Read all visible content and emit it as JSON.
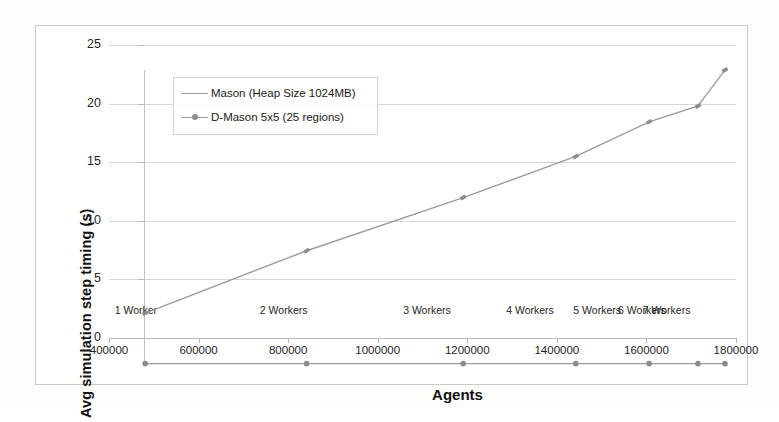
{
  "chart_data": {
    "type": "line",
    "title": "",
    "xlabel": "Agents",
    "ylabel": "Avg simulation step timing (s)",
    "xlim": [
      400000,
      1800000
    ],
    "ylim": [
      0,
      25
    ],
    "xticks": [
      "400000",
      "600000",
      "800000",
      "1000000",
      "1200000",
      "1400000",
      "1600000",
      "1800000"
    ],
    "xtick_values": [
      400000,
      600000,
      800000,
      1000000,
      1200000,
      1400000,
      1600000,
      1800000
    ],
    "yticks": [
      "0",
      "5",
      "10",
      "15",
      "20",
      "25"
    ],
    "ytick_values": [
      0,
      5,
      10,
      15,
      20,
      25
    ],
    "grid": true,
    "legend_position": "upper-left-inside",
    "x": [
      460000,
      790000,
      1110000,
      1340000,
      1490000,
      1590000,
      1645000
    ],
    "series": [
      {
        "name": "Mason (Heap Size 1024MB)",
        "color": "#9b9b9b",
        "marker": "dash",
        "values": [
          5.0,
          9.7,
          13.7,
          16.8,
          19.4,
          20.6,
          23.3
        ]
      },
      {
        "name": "D-Mason 5x5 (25 regions)",
        "color": "#8e8e8e",
        "marker": "circle",
        "values": [
          1.2,
          1.2,
          1.2,
          1.2,
          1.2,
          1.2,
          1.2
        ]
      }
    ],
    "annotations": [
      {
        "text": "1 Worker",
        "x": 460000,
        "y": 1.2
      },
      {
        "text": "2 Workers",
        "x": 790000,
        "y": 1.2
      },
      {
        "text": "3 Workers",
        "x": 1110000,
        "y": 1.2
      },
      {
        "text": "4 Workers",
        "x": 1340000,
        "y": 1.2
      },
      {
        "text": "5 Workers",
        "x": 1490000,
        "y": 1.2
      },
      {
        "text": "6 Workers",
        "x": 1590000,
        "y": 1.2
      },
      {
        "text": "7 Workers",
        "x": 1645000,
        "y": 1.2
      }
    ]
  }
}
